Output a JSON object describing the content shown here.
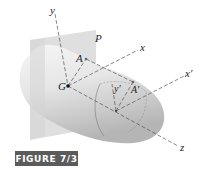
{
  "figure": {
    "caption": "FIGURE 7/3",
    "labels": {
      "y": "y",
      "x": "x",
      "x_prime": "x′",
      "z": "z",
      "y_prime": "y′",
      "A": "A",
      "A_prime": "A′",
      "G": "G",
      "P": "P"
    },
    "colors": {
      "caption_bg": "#5b5b5b",
      "caption_text": "#ffffff",
      "plane": "#d9d9d9",
      "body_light": "#f4f4f4",
      "body_dark": "#b8b8b8",
      "axis": "#555555"
    }
  }
}
